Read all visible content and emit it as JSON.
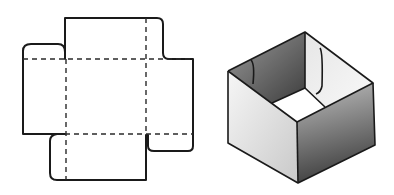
{
  "figure": {
    "colors": {
      "line": "#1a1a1a",
      "background": "#ffffff",
      "shade_dark": "#555555",
      "shade_light": "#f2f2f2"
    },
    "panels": [
      {
        "name": "net",
        "label": ""
      },
      {
        "name": "assembled-box",
        "label": ""
      }
    ]
  }
}
